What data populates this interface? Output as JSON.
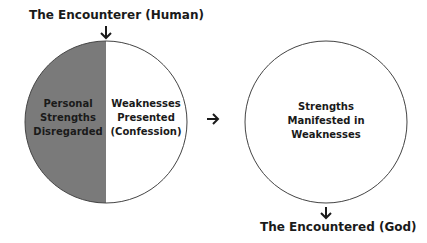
{
  "diagram": {
    "top_label": "The Encounterer (Human)",
    "bottom_label": "The Encountered (God)",
    "left_circle": {
      "left_half": {
        "lines": [
          "Personal",
          "Strengths",
          "Disregarded"
        ],
        "fill": "#7a7a7a"
      },
      "right_half": {
        "lines": [
          "Weaknesses",
          "Presented",
          "(Confession)"
        ],
        "fill": "#ffffff"
      }
    },
    "right_circle": {
      "lines": [
        "Strengths",
        "Manifested in",
        "Weaknesses"
      ]
    },
    "arrows": {
      "top_down": "↓",
      "middle_right": "→",
      "bottom_down": "↓"
    }
  }
}
